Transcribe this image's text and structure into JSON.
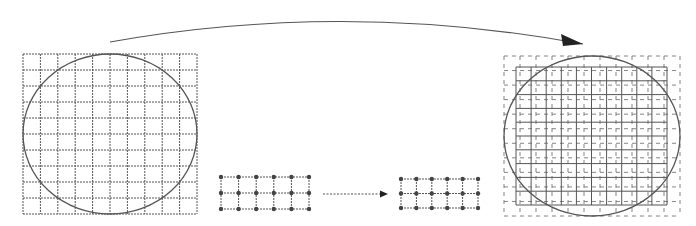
{
  "diagram": {
    "colors": {
      "background": "#ffffff",
      "stroke": "#555555",
      "dashed": "#777777",
      "dot": "#444444",
      "arrow": "#222222"
    },
    "left_grid": {
      "x": 23,
      "y": 54,
      "width": 174,
      "height": 160,
      "cols": 10,
      "rows": 10,
      "circle": {
        "cx": 110,
        "cy": 134,
        "rx": 87,
        "ry": 80
      }
    },
    "small_grid_a": {
      "x": 221,
      "y": 177,
      "width": 88,
      "height": 32,
      "cols": 5,
      "rows": 2,
      "dots": true
    },
    "small_grid_b": {
      "x": 401,
      "y": 179,
      "width": 77,
      "height": 29,
      "cols": 5,
      "rows": 2,
      "dots": true
    },
    "middle_arrow": {
      "x1": 323,
      "y1": 194,
      "x2": 388,
      "y2": 194,
      "style": "dotted"
    },
    "top_arrow": {
      "path": "M110,42 Q345,0 583,44",
      "head": [
        [
          583,
          44
        ],
        [
          561,
          34
        ],
        [
          563,
          46
        ]
      ]
    },
    "right_grid": {
      "outer": {
        "x": 504,
        "y": 56,
        "width": 176,
        "height": 160,
        "cols": 11,
        "rows": 11,
        "style": "dashed"
      },
      "inner": {
        "x": 516,
        "y": 67,
        "width": 151,
        "height": 138,
        "cols": 10,
        "rows": 10,
        "style": "solid"
      },
      "circle": {
        "cx": 592,
        "cy": 136,
        "rx": 88,
        "ry": 80
      }
    }
  }
}
